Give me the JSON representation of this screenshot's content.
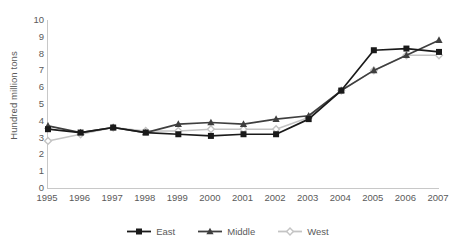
{
  "chart_data": {
    "type": "line",
    "title": "",
    "xlabel": "",
    "ylabel": "Hundred million tons",
    "categories": [
      "1995",
      "1996",
      "1997",
      "1998",
      "1999",
      "2000",
      "2001",
      "2002",
      "2003",
      "2004",
      "2005",
      "2006",
      "2007"
    ],
    "ylim": [
      0,
      10
    ],
    "y_ticks": [
      "0",
      "1",
      "2",
      "3",
      "4",
      "5",
      "6",
      "7",
      "8",
      "9",
      "10"
    ],
    "grid": false,
    "legend_position": "bottom",
    "series": [
      {
        "name": "East",
        "color": "#1a1a1a",
        "marker": "square",
        "values": [
          3.5,
          3.3,
          3.6,
          3.3,
          3.2,
          3.1,
          3.2,
          3.2,
          4.1,
          5.8,
          8.2,
          8.3,
          8.1
        ]
      },
      {
        "name": "Middle",
        "color": "#3f3f3f",
        "marker": "triangle",
        "values": [
          3.7,
          3.3,
          3.6,
          3.3,
          3.8,
          3.9,
          3.8,
          4.1,
          4.3,
          5.8,
          7.0,
          7.9,
          8.8
        ]
      },
      {
        "name": "West",
        "color": "#c4c4c4",
        "marker": "diamond",
        "values": [
          2.8,
          3.2,
          3.6,
          3.4,
          3.4,
          3.5,
          3.5,
          3.5,
          4.2,
          5.8,
          7.0,
          7.9,
          7.9
        ]
      }
    ]
  },
  "legend": {
    "items": [
      {
        "label": "East"
      },
      {
        "label": "Middle"
      },
      {
        "label": "West"
      }
    ]
  }
}
